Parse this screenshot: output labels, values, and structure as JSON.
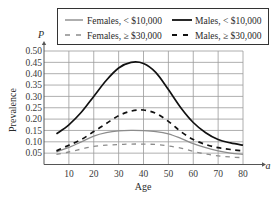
{
  "chart_data": {
    "type": "line",
    "title": "",
    "xlabel": "Age",
    "ylabel": "Prevalence",
    "x_axis_var": "a",
    "y_axis_var": "P",
    "xlim": [
      0,
      80
    ],
    "ylim": [
      0,
      0.5
    ],
    "grid": true,
    "legend_position": "top (boxed, 2×2)",
    "x_ticks": [
      10,
      20,
      30,
      40,
      50,
      60,
      70,
      80
    ],
    "y_ticks": [
      0.05,
      0.1,
      0.15,
      0.2,
      0.25,
      0.3,
      0.35,
      0.4,
      0.45,
      0.5
    ],
    "x_tick_labels": [
      "10",
      "20",
      "30",
      "40",
      "50",
      "60",
      "70",
      "80"
    ],
    "y_tick_labels": [
      "0.05",
      "0.10",
      "0.15",
      "0.20",
      "0.25",
      "0.30",
      "0.35",
      "0.40",
      "0.45",
      "0.50"
    ],
    "x": [
      5,
      10,
      15,
      20,
      25,
      30,
      35,
      40,
      45,
      50,
      55,
      60,
      65,
      70,
      75,
      80
    ],
    "series": [
      {
        "name": "Females, < $10,000",
        "style": "solid",
        "color": "#8c8c8c",
        "values": [
          0.055,
          0.075,
          0.1,
          0.125,
          0.14,
          0.148,
          0.15,
          0.149,
          0.145,
          0.135,
          0.115,
          0.092,
          0.074,
          0.06,
          0.05,
          0.045
        ]
      },
      {
        "name": "Males, < $10,000",
        "style": "solid",
        "color": "#111111",
        "values": [
          0.135,
          0.175,
          0.23,
          0.3,
          0.37,
          0.425,
          0.45,
          0.445,
          0.405,
          0.33,
          0.25,
          0.185,
          0.14,
          0.11,
          0.095,
          0.085
        ]
      },
      {
        "name": "Females, ≥ $30,000",
        "style": "dashed",
        "color": "#8c8c8c",
        "values": [
          0.045,
          0.055,
          0.068,
          0.08,
          0.085,
          0.088,
          0.09,
          0.09,
          0.088,
          0.082,
          0.072,
          0.058,
          0.046,
          0.038,
          0.033,
          0.03
        ]
      },
      {
        "name": "Males, ≥ $30,000",
        "style": "dashed",
        "color": "#111111",
        "values": [
          0.06,
          0.085,
          0.11,
          0.145,
          0.18,
          0.215,
          0.235,
          0.24,
          0.225,
          0.19,
          0.145,
          0.11,
          0.088,
          0.074,
          0.066,
          0.06
        ]
      }
    ]
  }
}
